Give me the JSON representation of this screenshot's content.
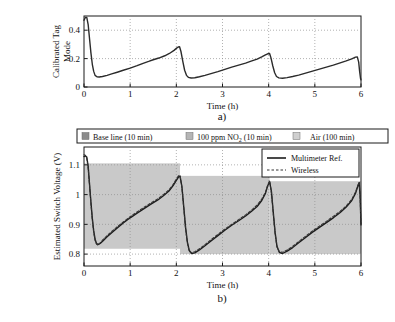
{
  "figure": {
    "panel_a_label": "a)",
    "panel_b_label": "b)"
  },
  "chart_data": [
    {
      "id": "panel_a",
      "type": "line",
      "title": "",
      "xlabel": "Time (h)",
      "ylabel": "Calibrated Tag Mode",
      "xlim": [
        0,
        6
      ],
      "ylim": [
        0,
        0.5
      ],
      "xticks": [
        0,
        1,
        2,
        3,
        4,
        5,
        6
      ],
      "xticklabels": [
        "0",
        "1",
        "2",
        "3",
        "4",
        "5",
        "6"
      ],
      "yticks": [
        0,
        0.2,
        0.4
      ],
      "yticklabels": [
        "0",
        "0.2",
        "0.4"
      ],
      "grid": true,
      "legend": "none",
      "series": [
        {
          "name": "Calibrated Tag Mode",
          "style": "solid",
          "color": "#2b2b2b",
          "points": [
            [
              0.0,
              0.47
            ],
            [
              0.03,
              0.49
            ],
            [
              0.06,
              0.49
            ],
            [
              0.09,
              0.44
            ],
            [
              0.12,
              0.34
            ],
            [
              0.15,
              0.24
            ],
            [
              0.18,
              0.16
            ],
            [
              0.21,
              0.11
            ],
            [
              0.24,
              0.082
            ],
            [
              0.28,
              0.072
            ],
            [
              0.33,
              0.07
            ],
            [
              0.4,
              0.074
            ],
            [
              0.5,
              0.082
            ],
            [
              0.6,
              0.092
            ],
            [
              0.72,
              0.104
            ],
            [
              0.85,
              0.118
            ],
            [
              1.0,
              0.133
            ],
            [
              1.15,
              0.15
            ],
            [
              1.28,
              0.167
            ],
            [
              1.4,
              0.18
            ],
            [
              1.5,
              0.192
            ],
            [
              1.62,
              0.204
            ],
            [
              1.75,
              0.22
            ],
            [
              1.85,
              0.236
            ],
            [
              1.95,
              0.258
            ],
            [
              2.0,
              0.272
            ],
            [
              2.04,
              0.282
            ],
            [
              2.07,
              0.283
            ],
            [
              2.1,
              0.25
            ],
            [
              2.14,
              0.18
            ],
            [
              2.18,
              0.118
            ],
            [
              2.22,
              0.082
            ],
            [
              2.26,
              0.068
            ],
            [
              2.32,
              0.063
            ],
            [
              2.4,
              0.065
            ],
            [
              2.5,
              0.072
            ],
            [
              2.62,
              0.082
            ],
            [
              2.75,
              0.094
            ],
            [
              2.9,
              0.108
            ],
            [
              3.05,
              0.124
            ],
            [
              3.2,
              0.14
            ],
            [
              3.35,
              0.154
            ],
            [
              3.5,
              0.168
            ],
            [
              3.62,
              0.182
            ],
            [
              3.75,
              0.196
            ],
            [
              3.85,
              0.212
            ],
            [
              3.93,
              0.226
            ],
            [
              3.98,
              0.234
            ],
            [
              4.02,
              0.236
            ],
            [
              4.05,
              0.205
            ],
            [
              4.09,
              0.148
            ],
            [
              4.13,
              0.1
            ],
            [
              4.17,
              0.074
            ],
            [
              4.22,
              0.064
            ],
            [
              4.3,
              0.062
            ],
            [
              4.4,
              0.066
            ],
            [
              4.52,
              0.074
            ],
            [
              4.65,
              0.084
            ],
            [
              4.8,
              0.098
            ],
            [
              4.95,
              0.112
            ],
            [
              5.1,
              0.126
            ],
            [
              5.25,
              0.14
            ],
            [
              5.4,
              0.154
            ],
            [
              5.55,
              0.17
            ],
            [
              5.68,
              0.184
            ],
            [
              5.8,
              0.198
            ],
            [
              5.88,
              0.21
            ],
            [
              5.92,
              0.212
            ],
            [
              5.95,
              0.175
            ],
            [
              5.97,
              0.11
            ],
            [
              5.99,
              0.06
            ],
            [
              6.0,
              0.05
            ]
          ]
        }
      ]
    },
    {
      "id": "panel_b",
      "type": "line",
      "title": "",
      "xlabel": "Time (h)",
      "ylabel": "Estimated Switch Voltage (V)",
      "xlim": [
        0,
        6
      ],
      "ylim": [
        0.76,
        1.16
      ],
      "xticks": [
        0,
        1,
        2,
        3,
        4,
        5,
        6
      ],
      "xticklabels": [
        "0",
        "1",
        "2",
        "3",
        "4",
        "5",
        "6"
      ],
      "yticks": [
        0.8,
        0.9,
        1.0,
        1.1
      ],
      "yticklabels": [
        "0.8",
        "0.9",
        "1",
        "1.1"
      ],
      "grid": true,
      "legend_position": "top-right-inset",
      "phase_legend": [
        {
          "label": "Base line (10 min)",
          "color": "#8c8c8c"
        },
        {
          "label": "100 ppm NO2 (10 min)",
          "color": "#b5b5b5"
        },
        {
          "label": "Air (100 min)",
          "color": "#cfcfcf"
        }
      ],
      "phase_legend_display": [
        {
          "label": "Base line (10 min)"
        },
        {
          "label_pre": "100 ppm NO",
          "label_sub": "2",
          "label_post": " (10 min)"
        },
        {
          "label": "Air (100 min)"
        }
      ],
      "shaded_bands": [
        {
          "x0": 0.0,
          "x1": 2.08,
          "y0": 0.818,
          "y1": 1.105,
          "color": "#c9c9c9"
        },
        {
          "x0": 2.08,
          "x1": 4.02,
          "y0": 0.8,
          "y1": 1.063,
          "color": "#c9c9c9"
        },
        {
          "x0": 4.02,
          "x1": 6.0,
          "y0": 0.8,
          "y1": 1.045,
          "color": "#c9c9c9"
        }
      ],
      "series": [
        {
          "name": "Multimeter Ref.",
          "style": "solid",
          "color": "#1c1c1c",
          "points": [
            [
              0.0,
              1.128
            ],
            [
              0.03,
              1.13
            ],
            [
              0.06,
              1.126
            ],
            [
              0.09,
              1.095
            ],
            [
              0.12,
              1.035
            ],
            [
              0.15,
              0.975
            ],
            [
              0.18,
              0.92
            ],
            [
              0.21,
              0.878
            ],
            [
              0.24,
              0.85
            ],
            [
              0.27,
              0.836
            ],
            [
              0.3,
              0.832
            ],
            [
              0.35,
              0.836
            ],
            [
              0.42,
              0.846
            ],
            [
              0.5,
              0.858
            ],
            [
              0.6,
              0.872
            ],
            [
              0.72,
              0.888
            ],
            [
              0.85,
              0.905
            ],
            [
              1.0,
              0.922
            ],
            [
              1.15,
              0.938
            ],
            [
              1.3,
              0.953
            ],
            [
              1.45,
              0.968
            ],
            [
              1.6,
              0.982
            ],
            [
              1.72,
              0.996
            ],
            [
              1.84,
              1.012
            ],
            [
              1.93,
              1.03
            ],
            [
              2.0,
              1.048
            ],
            [
              2.05,
              1.06
            ],
            [
              2.08,
              1.062
            ],
            [
              2.12,
              1.028
            ],
            [
              2.16,
              0.96
            ],
            [
              2.2,
              0.89
            ],
            [
              2.24,
              0.84
            ],
            [
              2.28,
              0.812
            ],
            [
              2.33,
              0.802
            ],
            [
              2.4,
              0.804
            ],
            [
              2.5,
              0.814
            ],
            [
              2.62,
              0.828
            ],
            [
              2.75,
              0.844
            ],
            [
              2.9,
              0.862
            ],
            [
              3.05,
              0.88
            ],
            [
              3.2,
              0.897
            ],
            [
              3.35,
              0.912
            ],
            [
              3.5,
              0.928
            ],
            [
              3.63,
              0.944
            ],
            [
              3.75,
              0.96
            ],
            [
              3.85,
              0.98
            ],
            [
              3.93,
              1.004
            ],
            [
              3.98,
              1.03
            ],
            [
              4.02,
              1.044
            ],
            [
              4.06,
              1.01
            ],
            [
              4.1,
              0.94
            ],
            [
              4.14,
              0.872
            ],
            [
              4.18,
              0.826
            ],
            [
              4.23,
              0.806
            ],
            [
              4.3,
              0.802
            ],
            [
              4.4,
              0.81
            ],
            [
              4.52,
              0.822
            ],
            [
              4.65,
              0.838
            ],
            [
              4.8,
              0.856
            ],
            [
              4.95,
              0.874
            ],
            [
              5.1,
              0.89
            ],
            [
              5.25,
              0.906
            ],
            [
              5.4,
              0.922
            ],
            [
              5.55,
              0.94
            ],
            [
              5.68,
              0.958
            ],
            [
              5.8,
              0.98
            ],
            [
              5.88,
              1.004
            ],
            [
              5.93,
              1.028
            ],
            [
              5.96,
              1.04
            ],
            [
              5.98,
              1.0
            ],
            [
              6.0,
              0.9
            ]
          ]
        },
        {
          "name": "Wireless",
          "style": "dashed",
          "color": "#333333",
          "points": [
            [
              0.0,
              1.134
            ],
            [
              0.03,
              1.132
            ],
            [
              0.06,
              1.122
            ],
            [
              0.09,
              1.09
            ],
            [
              0.12,
              1.03
            ],
            [
              0.15,
              0.97
            ],
            [
              0.18,
              0.916
            ],
            [
              0.21,
              0.874
            ],
            [
              0.24,
              0.846
            ],
            [
              0.27,
              0.834
            ],
            [
              0.3,
              0.83
            ],
            [
              0.35,
              0.838
            ],
            [
              0.42,
              0.85
            ],
            [
              0.5,
              0.862
            ],
            [
              0.6,
              0.876
            ],
            [
              0.72,
              0.892
            ],
            [
              0.85,
              0.908
            ],
            [
              1.0,
              0.926
            ],
            [
              1.15,
              0.942
            ],
            [
              1.3,
              0.957
            ],
            [
              1.45,
              0.972
            ],
            [
              1.6,
              0.986
            ],
            [
              1.72,
              1.0
            ],
            [
              1.84,
              1.016
            ],
            [
              1.93,
              1.034
            ],
            [
              2.0,
              1.052
            ],
            [
              2.05,
              1.064
            ],
            [
              2.08,
              1.064
            ],
            [
              2.12,
              1.024
            ],
            [
              2.16,
              0.956
            ],
            [
              2.2,
              0.886
            ],
            [
              2.24,
              0.836
            ],
            [
              2.28,
              0.81
            ],
            [
              2.33,
              0.804
            ],
            [
              2.4,
              0.808
            ],
            [
              2.5,
              0.818
            ],
            [
              2.62,
              0.832
            ],
            [
              2.75,
              0.848
            ],
            [
              2.9,
              0.866
            ],
            [
              3.05,
              0.884
            ],
            [
              3.2,
              0.9
            ],
            [
              3.35,
              0.916
            ],
            [
              3.5,
              0.932
            ],
            [
              3.63,
              0.948
            ],
            [
              3.75,
              0.965
            ],
            [
              3.85,
              0.985
            ],
            [
              3.93,
              1.008
            ],
            [
              3.98,
              1.032
            ],
            [
              4.02,
              1.046
            ],
            [
              4.06,
              1.006
            ],
            [
              4.1,
              0.936
            ],
            [
              4.14,
              0.868
            ],
            [
              4.18,
              0.824
            ],
            [
              4.23,
              0.808
            ],
            [
              4.3,
              0.806
            ],
            [
              4.4,
              0.814
            ],
            [
              4.52,
              0.826
            ],
            [
              4.65,
              0.842
            ],
            [
              4.8,
              0.86
            ],
            [
              4.95,
              0.878
            ],
            [
              5.1,
              0.894
            ],
            [
              5.25,
              0.91
            ],
            [
              5.4,
              0.927
            ],
            [
              5.55,
              0.944
            ],
            [
              5.68,
              0.962
            ],
            [
              5.8,
              0.984
            ],
            [
              5.88,
              1.008
            ],
            [
              5.93,
              1.03
            ],
            [
              5.96,
              1.042
            ],
            [
              5.98,
              0.995
            ],
            [
              6.0,
              0.895
            ]
          ]
        }
      ]
    }
  ]
}
